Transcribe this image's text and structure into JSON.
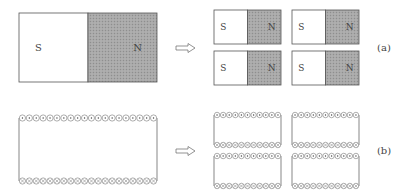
{
  "figure": {
    "rows": [
      {
        "id": "a",
        "label": "(a)",
        "kind": "bar-magnet",
        "whole": {
          "south_label": "S",
          "north_label": "N"
        },
        "pieces": [
          {
            "south_label": "S",
            "north_label": "N"
          },
          {
            "south_label": "S",
            "north_label": "N"
          },
          {
            "south_label": "S",
            "north_label": "N"
          },
          {
            "south_label": "S",
            "north_label": "N"
          }
        ]
      },
      {
        "id": "b",
        "label": "(b)",
        "kind": "solenoid",
        "whole": {
          "top_row": "current out of page (dots)",
          "bottom_row": "current into page (crosses)",
          "turns": 20
        },
        "pieces_count": 4,
        "piece_turns": 11
      }
    ],
    "arrow": "hollow-right-arrow",
    "colors": {
      "north_fill": "#a8a8a8",
      "outline": "#555555",
      "coil": "#777777"
    }
  }
}
